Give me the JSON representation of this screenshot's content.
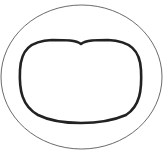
{
  "diagram": {
    "outer_ellipse": {
      "cx": 81.5,
      "cy": 77,
      "rx": 80.5,
      "ry": 72,
      "stroke": "#444444",
      "stroke_width": 0.8
    },
    "inner_shape": {
      "stroke": "#222222",
      "stroke_width": 2.6
    },
    "background": "#ffffff"
  }
}
